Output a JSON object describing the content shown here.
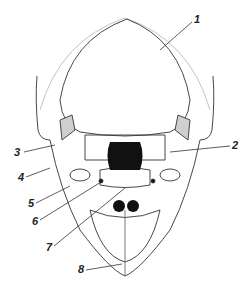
{
  "figure": {
    "colors": {
      "line": "#333333",
      "suture_fill": "#cfcfcf",
      "dark_fill": "#111111",
      "bg": "#ffffff"
    },
    "labels": [
      {
        "text": "1",
        "x": 194,
        "y": 16
      },
      {
        "text": "2",
        "x": 232,
        "y": 142
      },
      {
        "text": "3",
        "x": 16,
        "y": 148
      },
      {
        "text": "4",
        "x": 18,
        "y": 173
      },
      {
        "text": "5",
        "x": 28,
        "y": 200
      },
      {
        "text": "6",
        "x": 32,
        "y": 218
      },
      {
        "text": "7",
        "x": 46,
        "y": 244
      },
      {
        "text": "8",
        "x": 78,
        "y": 266
      }
    ]
  }
}
